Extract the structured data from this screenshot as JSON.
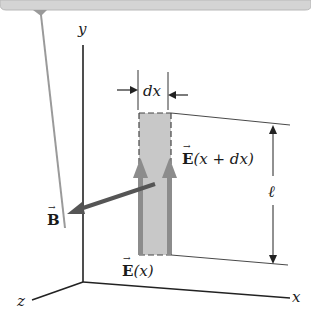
{
  "figure": {
    "axes": {
      "x_label": "x",
      "y_label": "y",
      "z_label": "z"
    },
    "width_label": "dx",
    "height_label": "ℓ",
    "field_labels": {
      "E_left": {
        "symbol": "E",
        "arg": "(x)"
      },
      "E_right": {
        "symbol": "E",
        "arg": "(x + dx)"
      },
      "B": {
        "symbol": "B"
      }
    },
    "colors": {
      "strip_fill": "#c8c8c8",
      "arrow_gray": "#8c8c8c",
      "b_arrow": "#555555",
      "banner": "#d4d4d4",
      "line": "#222222"
    }
  }
}
